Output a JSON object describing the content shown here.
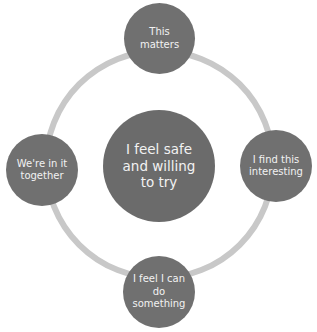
{
  "diagram": {
    "type": "cycle",
    "colors": {
      "ring": "#c8c8c8",
      "node": "#707070",
      "center": "#6b6b6b",
      "text": "#f2f2f2"
    },
    "center": {
      "label": "I feel safe and willing to try"
    },
    "nodes": [
      {
        "position": "top",
        "label": "This matters"
      },
      {
        "position": "right",
        "label": "I find this interesting"
      },
      {
        "position": "bottom",
        "label": "I feel I can do something"
      },
      {
        "position": "left",
        "label": "We're in it together"
      }
    ]
  }
}
